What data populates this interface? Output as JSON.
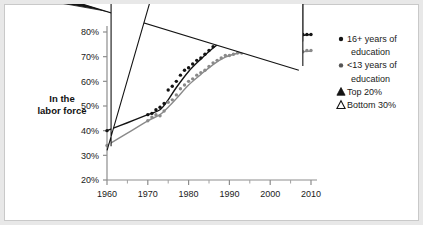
{
  "chart_data": {
    "type": "scatter",
    "title": "",
    "xlabel": "",
    "ylabel": "In the labor force",
    "ylabel_line1": "In the",
    "ylabel_line2": "labor force",
    "xlim": [
      1958,
      2012
    ],
    "ylim": [
      20,
      84
    ],
    "grid": false,
    "legend_position": "right",
    "x_ticks": [
      1960,
      1970,
      1980,
      1990,
      2000,
      2010
    ],
    "x_tick_labels": [
      "1960",
      "1970",
      "1980",
      "1990",
      "2000",
      "2010"
    ],
    "x_minor_ticks": [
      1965,
      1975,
      1985,
      1995,
      2005
    ],
    "y_ticks": [
      20,
      30,
      40,
      50,
      60,
      70,
      80
    ],
    "y_tick_labels": [
      "20%",
      "30%",
      "40%",
      "50%",
      "60%",
      "70%",
      "80%"
    ],
    "series": [
      {
        "name": "16+ years of education",
        "marker": "filled-circle",
        "color": "#141414",
        "x": [
          1960,
          1970,
          1971,
          1972,
          1973,
          1974,
          1975,
          1976,
          1977,
          1978,
          1979,
          1980,
          1981,
          1982,
          1983,
          1984,
          1985,
          1986,
          1987,
          1988,
          1989,
          1990,
          1991,
          1992,
          1993,
          1994,
          1995,
          1996,
          1997,
          1998,
          1999,
          2000,
          2001,
          2002,
          2003,
          2004,
          2005,
          2006,
          2007,
          2008,
          2009,
          2010
        ],
        "values": [
          40.0,
          46.5,
          47.0,
          48.5,
          49.5,
          51.0,
          56.5,
          58.0,
          60.0,
          62.5,
          64.5,
          65.5,
          67.0,
          68.5,
          69.5,
          71.0,
          72.5,
          74.0,
          76.0,
          77.5,
          77.0,
          78.0,
          78.5,
          79.0,
          79.5,
          81.0,
          80.5,
          80.5,
          80.0,
          80.5,
          80.0,
          80.0,
          79.5,
          77.5,
          77.0,
          77.5,
          78.0,
          78.5,
          78.5,
          79.0,
          79.0,
          79.0
        ]
      },
      {
        "name": "<13 years of education",
        "marker": "filled-circle",
        "color": "#8a8a8a",
        "x": [
          1960,
          1970,
          1971,
          1972,
          1973,
          1974,
          1975,
          1976,
          1977,
          1978,
          1979,
          1980,
          1981,
          1982,
          1983,
          1984,
          1985,
          1986,
          1987,
          1988,
          1989,
          1990,
          1991,
          1992,
          1993,
          1994,
          1995,
          1996,
          1997,
          1998,
          1999,
          2000,
          2001,
          2002,
          2003,
          2004,
          2005,
          2006,
          2007,
          2008,
          2009,
          2010
        ],
        "values": [
          34.0,
          44.0,
          45.5,
          46.5,
          46.0,
          48.0,
          51.5,
          52.5,
          54.5,
          57.0,
          58.5,
          60.0,
          61.0,
          62.5,
          63.5,
          64.5,
          66.0,
          67.5,
          68.5,
          69.5,
          70.5,
          70.5,
          71.0,
          71.5,
          71.5,
          72.5,
          72.5,
          73.0,
          72.5,
          73.0,
          73.0,
          73.0,
          74.5,
          73.5,
          74.0,
          72.5,
          72.5,
          72.0,
          71.5,
          72.0,
          72.5,
          72.5
        ]
      }
    ],
    "trend_lines": [
      {
        "name": "16+ years of education trend",
        "color": "#141414",
        "x": [
          1960,
          1965,
          1970,
          1973,
          1975,
          1977,
          1980,
          1983,
          1986,
          1989,
          1992,
          1995,
          1998,
          2001,
          2004,
          2007,
          2010
        ],
        "values": [
          40.0,
          43.2,
          46.5,
          48.5,
          52.5,
          57.5,
          64.0,
          69.0,
          73.5,
          77.0,
          79.3,
          80.4,
          80.5,
          79.5,
          77.4,
          78.4,
          79.0
        ]
      },
      {
        "name": "<13 years of education trend",
        "color": "#8a8a8a",
        "x": [
          1960,
          1965,
          1970,
          1973,
          1975,
          1977,
          1980,
          1983,
          1986,
          1989,
          1992,
          1995,
          1998,
          2001,
          2004,
          2007,
          2010
        ],
        "values": [
          34.0,
          39.0,
          44.0,
          46.5,
          49.5,
          53.0,
          58.5,
          62.8,
          66.8,
          69.8,
          71.4,
          72.3,
          72.6,
          72.6,
          72.3,
          72.0,
          72.2
        ]
      }
    ],
    "special_markers": [
      {
        "name": "Top 20%",
        "marker": "filled-triangle",
        "color": "#141414",
        "x": 2008,
        "value": 74.5
      },
      {
        "name": "Bottom 30%",
        "marker": "open-triangle",
        "color": "#141414",
        "x": 2008,
        "value": 64.5
      },
      {
        "name": "Bottom 30% early",
        "marker": "open-triangle",
        "color": "#141414",
        "x": 1961,
        "value": 32.0
      }
    ]
  },
  "legend": {
    "items": [
      {
        "marker": "filled-circle",
        "color": "#141414",
        "line1": "16+ years of",
        "line2": "education"
      },
      {
        "marker": "filled-circle",
        "color": "#555555",
        "line1": "<13 years of",
        "line2": "education"
      },
      {
        "marker": "filled-triangle",
        "color": "#141414",
        "line1": "Top 20%",
        "line2": ""
      },
      {
        "marker": "open-triangle",
        "color": "#141414",
        "line1": "Bottom 30%",
        "line2": ""
      }
    ]
  }
}
